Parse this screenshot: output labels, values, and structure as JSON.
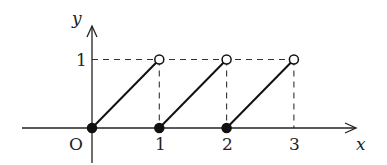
{
  "chart_data": {
    "type": "line",
    "title": "",
    "xlabel": "x",
    "ylabel": "y",
    "origin_label": "O",
    "x_ticks": [
      "1",
      "2",
      "3"
    ],
    "y_ticks": [
      "1"
    ],
    "xlim": [
      -1,
      4
    ],
    "ylim": [
      -0.5,
      1.45
    ],
    "segments": [
      {
        "start": [
          0,
          0
        ],
        "end": [
          1,
          1
        ],
        "start_closed": true,
        "end_closed": false
      },
      {
        "start": [
          1,
          0
        ],
        "end": [
          2,
          1
        ],
        "start_closed": true,
        "end_closed": false
      },
      {
        "start": [
          2,
          0
        ],
        "end": [
          3,
          1
        ],
        "start_closed": true,
        "end_closed": false
      }
    ],
    "guide_lines": {
      "horizontal_y": 1,
      "vertical_x": [
        1,
        2,
        3
      ],
      "style": "dashed"
    }
  }
}
